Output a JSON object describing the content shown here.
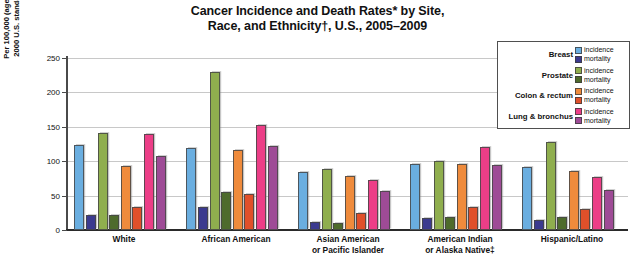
{
  "title": {
    "line1": "Cancer Incidence and Death Rates* by Site,",
    "line2": "Race, and Ethnicity†, U.S., 2005–2009"
  },
  "axis": {
    "y_title_line1": "Per 100,000 (age adjusted to the",
    "y_title_line2": "2000 U.S. standard population)",
    "y_ticks": [
      "250",
      "200",
      "150",
      "100",
      "50",
      "0"
    ]
  },
  "legend": {
    "rows": [
      {
        "site": "Breast",
        "incidence_label": "incidence",
        "mortality_label": "mortality",
        "incidence_color": "#6aaee0",
        "mortality_color": "#3b3a8f"
      },
      {
        "site": "Prostate",
        "incidence_label": "incidence",
        "mortality_label": "mortality",
        "incidence_color": "#8fae4e",
        "mortality_color": "#4e6b2c"
      },
      {
        "site": "Colon & rectum",
        "incidence_label": "incidence",
        "mortality_label": "mortality",
        "incidence_color": "#ef8b3c",
        "mortality_color": "#e0502a"
      },
      {
        "site": "Lung & bronchus",
        "incidence_label": "incidence",
        "mortality_label": "mortality",
        "incidence_color": "#ec3e87",
        "mortality_color": "#9e4b96"
      }
    ]
  },
  "chart_data": {
    "type": "bar",
    "title": "Cancer Incidence and Death Rates* by Site, Race, and Ethnicity†, U.S., 2005–2009",
    "xlabel": "",
    "ylabel": "Per 100,000 (age adjusted to the 2000 U.S. standard population)",
    "ylim": [
      0,
      250
    ],
    "ytick_step": 50,
    "grid": true,
    "legend_position": "top-right",
    "categories": [
      "White",
      "African American",
      "Asian American or Pacific Islander",
      "American Indian or Alaska Native‡",
      "Hispanic/Latino"
    ],
    "category_labels": [
      [
        "White"
      ],
      [
        "African American"
      ],
      [
        "Asian American",
        "or Pacific Islander"
      ],
      [
        "American Indian",
        "or Alaska Native‡"
      ],
      [
        "Hispanic/Latino"
      ]
    ],
    "series": [
      {
        "name": "Breast incidence",
        "site": "Breast",
        "measure": "incidence",
        "color": "#6aaee0",
        "values": [
          123,
          119,
          85,
          96,
          92
        ]
      },
      {
        "name": "Breast mortality",
        "site": "Breast",
        "measure": "mortality",
        "color": "#3b3a8f",
        "values": [
          22,
          33,
          12,
          17,
          15
        ]
      },
      {
        "name": "Prostate incidence",
        "site": "Prostate",
        "measure": "incidence",
        "color": "#8fae4e",
        "values": [
          141,
          230,
          88,
          101,
          128
        ]
      },
      {
        "name": "Prostate mortality",
        "site": "Prostate",
        "measure": "mortality",
        "color": "#4e6b2c",
        "values": [
          22,
          55,
          10,
          19,
          19
        ]
      },
      {
        "name": "Colon & rectum incidence",
        "site": "Colon & rectum",
        "measure": "incidence",
        "color": "#ef8b3c",
        "values": [
          93,
          116,
          79,
          96,
          86
        ]
      },
      {
        "name": "Colon & rectum mortality",
        "site": "Colon & rectum",
        "measure": "mortality",
        "color": "#e0502a",
        "values": [
          34,
          52,
          25,
          33,
          30
        ]
      },
      {
        "name": "Lung & bronchus incidence",
        "site": "Lung & bronchus",
        "measure": "incidence",
        "color": "#ec3e87",
        "values": [
          140,
          153,
          73,
          121,
          77
        ]
      },
      {
        "name": "Lung & bronchus mortality",
        "site": "Lung & bronchus",
        "measure": "mortality",
        "color": "#9e4b96",
        "values": [
          108,
          122,
          56,
          95,
          58
        ]
      }
    ]
  }
}
